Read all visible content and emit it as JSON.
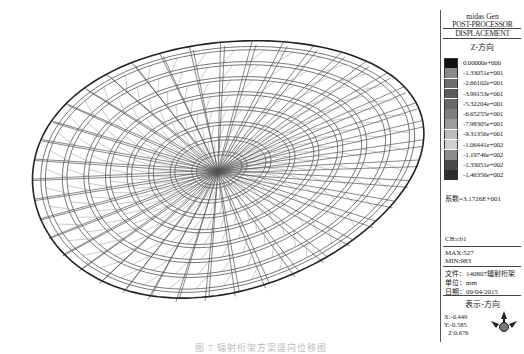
{
  "app": {
    "brand": "midas Gen",
    "mode": "POST-PROCESSOR",
    "result_type": "DISPLACEMENT"
  },
  "legend": {
    "component": "Z-方向",
    "scale": [
      {
        "value": "0.00000e+000",
        "color": "#111111"
      },
      {
        "value": "-1.33051e+001",
        "color": "#8a8a8a"
      },
      {
        "value": "-2.66102e+001",
        "color": "#6e6e6e"
      },
      {
        "value": "-3.99153e+001",
        "color": "#5c5c5c"
      },
      {
        "value": "-5.32204e+001",
        "color": "#6a6a6a"
      },
      {
        "value": "-6.65255e+001",
        "color": "#7e7e7e"
      },
      {
        "value": "-7.98305e+001",
        "color": "#9c9c9c"
      },
      {
        "value": "-9.31356e+001",
        "color": "#bdbdbd"
      },
      {
        "value": "-1.06441e+002",
        "color": "#cfcfcf"
      },
      {
        "value": "-1.19746e+002",
        "color": "#8c8c8c"
      },
      {
        "value": "-1.33051e+002",
        "color": "#4a4a4a"
      },
      {
        "value": "-1.46356e+002",
        "color": "#2e2e2e"
      }
    ],
    "factor": "系数=3.1726E+001",
    "load_case": "CB:cb1",
    "max": "MAX:527",
    "min": "MIN:983",
    "file": "文件：140807辐射桁架",
    "unit": "单位：mm",
    "date": "日期：09/04/2015",
    "view_direction_title": "表示-方向",
    "view": {
      "x": "X:-0.449",
      "y": "Y:-0.585",
      "z": "Z:0.676"
    }
  },
  "model": {
    "description": "Radial truss elliptical roof wireframe (3D view)",
    "rings": 8,
    "radial_members": 40
  },
  "caption": "图 7  辐射桁架方案竖向位移图"
}
